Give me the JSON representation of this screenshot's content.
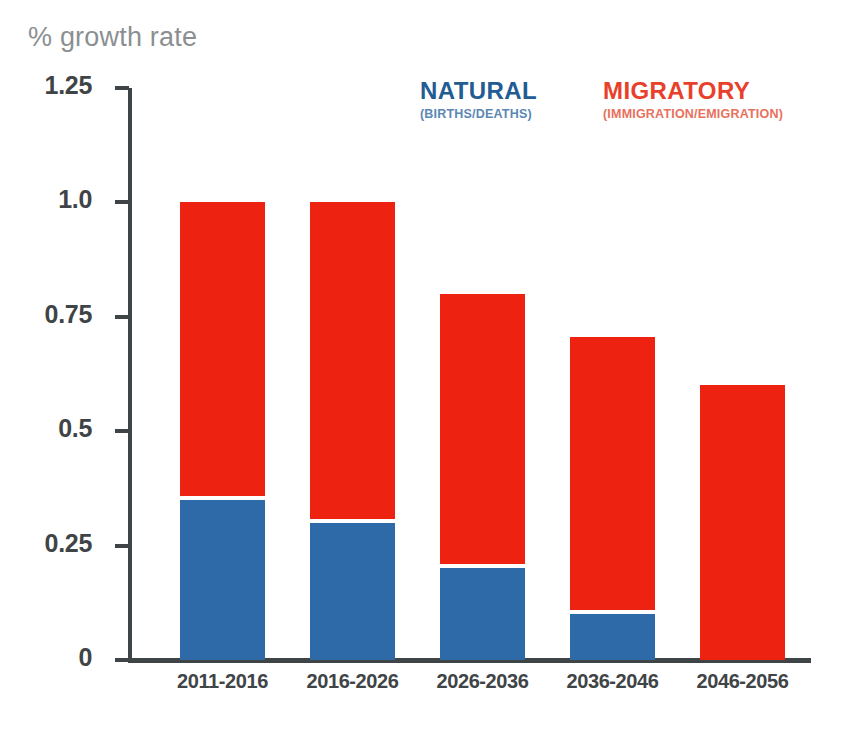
{
  "axis_title": "% growth rate",
  "legend": {
    "natural": {
      "title": "NATURAL",
      "subtitle": "(BIRTHS/DEATHS)",
      "color": "#225C93"
    },
    "migratory": {
      "title": "MIGRATORY",
      "subtitle": "(IMMIGRATION/EMIGRATION)",
      "color": "#E8402A"
    }
  },
  "chart_data": {
    "type": "bar",
    "title": "",
    "subtitle": "",
    "xlabel": "",
    "ylabel": "% growth rate",
    "stacked": true,
    "grid": false,
    "legend_position": "top-right",
    "ylim": [
      0,
      1.25
    ],
    "yticks": [
      0,
      0.25,
      0.5,
      0.75,
      1.0,
      1.25
    ],
    "ytick_labels": [
      "0",
      "0.25",
      "0.5",
      "0.75",
      "1.0",
      "1.25"
    ],
    "categories": [
      "2011-2016",
      "2016-2026",
      "2026-2036",
      "2036-2046",
      "2046-2056"
    ],
    "series": [
      {
        "name": "NATURAL",
        "label": "NATURAL (BIRTHS/DEATHS)",
        "color": "#2E69A8",
        "values": [
          0.35,
          0.3,
          0.2,
          0.1,
          0.0
        ]
      },
      {
        "name": "MIGRATORY",
        "label": "MIGRATORY (IMMIGRATION/EMIGRATION)",
        "color": "#EE2211",
        "values": [
          0.65,
          0.7,
          0.6,
          0.605,
          0.6
        ]
      }
    ],
    "totals": [
      1.0,
      1.0,
      0.8,
      0.705,
      0.6
    ]
  },
  "ticks": [
    {
      "label": "1.25",
      "value": 1.25
    },
    {
      "label": "1.0",
      "value": 1.0
    },
    {
      "label": "0.75",
      "value": 0.75
    },
    {
      "label": "0.5",
      "value": 0.5
    },
    {
      "label": "0.25",
      "value": 0.25
    },
    {
      "label": "0",
      "value": 0
    }
  ]
}
